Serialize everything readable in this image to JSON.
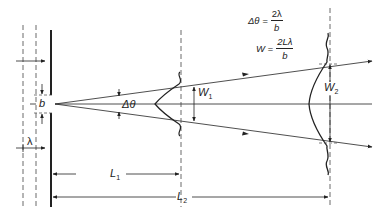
{
  "figure": {
    "formulas": {
      "angle": {
        "lhs": "Δθ =",
        "numerator": "2λ",
        "denominator": "b"
      },
      "width": {
        "lhs": "W =",
        "numerator": "2Lλ",
        "denominator": "b"
      }
    },
    "labels": {
      "slit_width": "b",
      "wavelength": "λ",
      "divergence_angle": "Δθ",
      "width_1": {
        "main": "W",
        "sub": "1"
      },
      "width_2": {
        "main": "W",
        "sub": "2"
      },
      "distance_1": {
        "main": "L",
        "sub": "1"
      },
      "distance_2": {
        "main": "L",
        "sub": "2"
      }
    },
    "colors": {
      "ink": "#222222",
      "background": "#ffffff"
    }
  }
}
